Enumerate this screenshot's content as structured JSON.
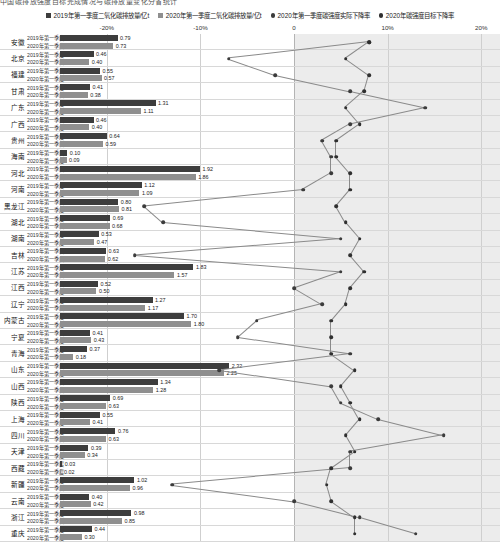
{
  "top_strip": "中国碳排放强度目标完成情况与碳排放量变化分省统计",
  "legend": [
    {
      "label": "2019年第一季度二氧化碳排放量/亿t",
      "marker": "square",
      "color": "#3d3d3d",
      "name": "legend-2019-emissions"
    },
    {
      "label": "2020年第一季度二氧化碳排放量/亿t",
      "marker": "square",
      "color": "#8f8f8f",
      "name": "legend-2020-emissions"
    },
    {
      "label": "2020年第一季度碳强度实际下降率",
      "marker": "dot",
      "color": "#3b3b3b",
      "name": "legend-actual-rate"
    },
    {
      "label": "2020年碳强度目标下降率",
      "marker": "dot",
      "color": "#2f2f2f",
      "name": "legend-target-rate"
    }
  ],
  "axis": {
    "ticks": [
      "-20%",
      "-10%",
      "0",
      "10%",
      "20%"
    ],
    "tick_values": [
      -20,
      -10,
      0,
      10,
      20
    ],
    "min": -25,
    "max": 22,
    "shaded_from": 0,
    "shaded_to": 22
  },
  "row_sub_labels": [
    "2019年第一季度",
    "2020年第一季度"
  ],
  "chart_data": {
    "type": "bar",
    "xlabel": "",
    "ylabel": "",
    "xlim": [
      -25,
      22
    ],
    "grid": true,
    "legend_position": "top",
    "categories": [
      "安徽",
      "北京",
      "福建",
      "甘肃",
      "广东",
      "广西",
      "贵州",
      "海南",
      "河北",
      "河南",
      "黑龙江",
      "湖北",
      "湖南",
      "吉林",
      "江苏",
      "江西",
      "辽宁",
      "内蒙古",
      "宁夏",
      "青海",
      "山东",
      "山西",
      "陕西",
      "上海",
      "四川",
      "天津",
      "西藏",
      "新疆",
      "云南",
      "浙江",
      "重庆"
    ],
    "series": [
      {
        "name": "2019年第一季度二氧化碳排放量/亿t",
        "values": [
          0.79,
          0.46,
          0.55,
          0.41,
          1.31,
          0.46,
          0.64,
          0.1,
          1.92,
          1.12,
          0.8,
          0.69,
          0.53,
          0.63,
          1.83,
          0.52,
          1.27,
          1.7,
          0.41,
          0.37,
          2.32,
          1.34,
          0.69,
          0.55,
          0.76,
          0.39,
          0.03,
          1.02,
          0.4,
          0.98,
          0.44
        ]
      },
      {
        "name": "2020年第一季度二氧化碳排放量/亿t",
        "values": [
          0.73,
          0.4,
          0.57,
          0.38,
          1.11,
          0.4,
          0.59,
          0.09,
          1.86,
          1.09,
          0.81,
          0.68,
          0.47,
          0.62,
          1.57,
          0.5,
          1.17,
          1.8,
          0.43,
          0.18,
          2.25,
          1.28,
          0.63,
          0.41,
          0.63,
          0.34,
          0.02,
          0.96,
          0.42,
          0.85,
          0.3
        ]
      },
      {
        "name": "2020年第一季度碳强度实际下降率",
        "values": [
          8.0,
          -7.0,
          -2.0,
          6.0,
          14.0,
          6.0,
          3.0,
          4.0,
          4.0,
          1.0,
          -16.0,
          -14.0,
          5.0,
          -17.0,
          5.0,
          0.0,
          3.0,
          -4.0,
          -6.0,
          6.0,
          -8.0,
          4.0,
          5.0,
          9.0,
          16.0,
          6.0,
          6.0,
          -13.0,
          0.0,
          7.0,
          13.0
        ]
      },
      {
        "name": "2020年碳强度目标下降率",
        "values": [
          8.0,
          5.5,
          8.0,
          7.5,
          5.5,
          7.0,
          4.5,
          4.5,
          6.0,
          6.0,
          4.5,
          5.5,
          7.0,
          6.0,
          7.5,
          6.0,
          5.5,
          4.0,
          4.0,
          4.0,
          6.5,
          5.0,
          6.0,
          7.0,
          5.5,
          6.5,
          4.0,
          3.5,
          4.0,
          6.5,
          6.5
        ]
      }
    ]
  }
}
